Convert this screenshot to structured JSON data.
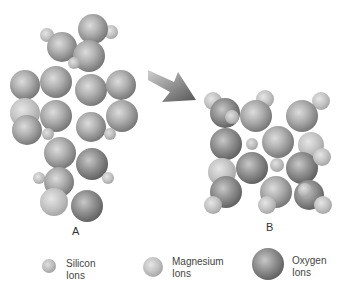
{
  "structures": {
    "a_label": "A",
    "b_label": "B"
  },
  "arrow": {
    "icon": "transform-arrow-icon",
    "color": "#555555"
  },
  "legend": [
    {
      "line1": "Silicon",
      "line2": "Ions",
      "icon": "silicon-ion-icon"
    },
    {
      "line1": "Magnesium",
      "line2": "Ions",
      "icon": "magnesium-ion-icon"
    },
    {
      "line1": "Oxygen",
      "line2": "Ions",
      "icon": "oxygen-ion-icon"
    }
  ]
}
